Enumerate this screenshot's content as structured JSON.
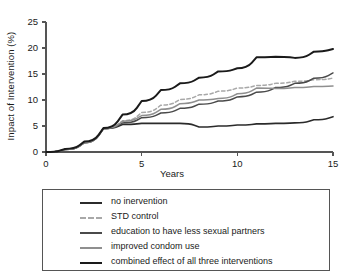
{
  "chart_data": {
    "type": "line",
    "title": "",
    "xlabel": "Years",
    "ylabel": "Inpact of Intervention (%)",
    "xlim": [
      0,
      15
    ],
    "ylim": [
      0,
      25
    ],
    "xticks": [
      "0",
      "5",
      "10",
      "15"
    ],
    "xtick_values": [
      0,
      5,
      10,
      15
    ],
    "yticks": [
      "0",
      "5",
      "10",
      "15",
      "20",
      "25"
    ],
    "ytick_values": [
      0,
      5,
      10,
      15,
      20,
      25
    ],
    "grid": false,
    "legend_position": "below-plot",
    "x": [
      0,
      1,
      2,
      3,
      4,
      5,
      6,
      7,
      8,
      9,
      10,
      11,
      12,
      13,
      14,
      15
    ],
    "series": [
      {
        "name": "no inervention",
        "label": "no inervention",
        "color": "#2b2b2b",
        "style": "solid",
        "width": 1.6,
        "values": [
          0,
          0.5,
          1.8,
          4.5,
          5.3,
          5.5,
          5.5,
          5.5,
          4.8,
          5.0,
          5.2,
          5.4,
          5.5,
          5.6,
          6.2,
          6.8
        ]
      },
      {
        "name": "STD control",
        "label": "STD control",
        "color": "#a8a8a8",
        "style": "dashed",
        "width": 1.5,
        "values": [
          0,
          0.5,
          1.8,
          4.5,
          6.0,
          7.6,
          9.0,
          10.1,
          11.0,
          11.7,
          12.3,
          12.8,
          13.2,
          13.6,
          13.9,
          14.2
        ]
      },
      {
        "name": "education to have less sexual partners",
        "label": "education to have less sexual partners",
        "color": "#4a4a4a",
        "style": "solid",
        "width": 1.5,
        "values": [
          0,
          0.5,
          1.8,
          4.5,
          5.6,
          6.6,
          7.5,
          8.4,
          9.2,
          9.8,
          10.6,
          11.5,
          12.4,
          13.2,
          14.2,
          15.2
        ]
      },
      {
        "name": "improved condom use",
        "label": "improved condom use",
        "color": "#8f8f8f",
        "style": "solid",
        "width": 1.5,
        "values": [
          0,
          0.5,
          1.8,
          4.5,
          5.9,
          7.0,
          8.2,
          9.3,
          10.0,
          10.3,
          11.2,
          12.3,
          12.2,
          12.4,
          12.6,
          12.7
        ]
      },
      {
        "name": "combined effect of all three interventions",
        "label": "combined effect of all three interventions",
        "color": "#1a1a1a",
        "style": "solid",
        "width": 2.0,
        "values": [
          0,
          0.6,
          2.0,
          4.6,
          7.2,
          9.8,
          11.9,
          13.2,
          14.3,
          15.5,
          16.1,
          18.2,
          18.3,
          18.1,
          19.3,
          19.8
        ]
      }
    ]
  }
}
